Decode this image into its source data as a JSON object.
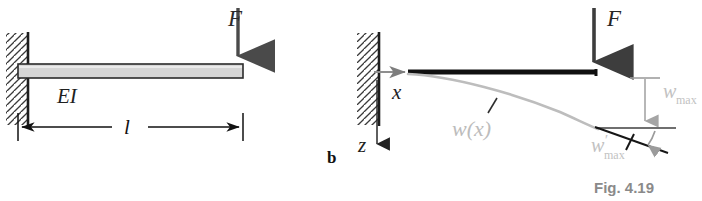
{
  "figure": {
    "caption": "Fig. 4.19",
    "caption_color": "#8a8a8a",
    "background": "#ffffff",
    "width": 702,
    "height": 201
  },
  "colors": {
    "ink_black": "#1a1a1a",
    "beam_outline": "#2b2b2b",
    "beam_fill": "#d6d6d6",
    "force_arrow": "#4a4a4a",
    "deflection_gray": "#b8b8b8",
    "axis_gray": "#9a9a9a",
    "hatch_gray": "#3a3a3a",
    "dimension_black": "#111111"
  },
  "panel_a": {
    "name": "undeformed-cantilever",
    "letter": "",
    "force_label": "F",
    "stiffness_label": "EI",
    "length_label": "l",
    "support_type": "fixed-wall-hatched",
    "beam": {
      "x_start": 18,
      "x_end": 243,
      "y_top": 64,
      "y_bottom": 78,
      "fill": "#d6d6d6",
      "stroke": "#2b2b2b"
    },
    "force": {
      "x": 238,
      "y_tail": 8,
      "y_head": 64,
      "direction": "down"
    },
    "dimension": {
      "y": 127,
      "x_left": 18,
      "x_right": 243,
      "label": "l"
    }
  },
  "panel_b": {
    "name": "deformed-cantilever",
    "letter": "b",
    "force_label": "F",
    "axis_x_label": "x",
    "axis_z_label": "z",
    "deflection_curve_label": "w(x)",
    "max_deflection_label_base": "w",
    "max_deflection_label_sub": "max",
    "max_slope_label_base": "w",
    "max_slope_label_prime": "′",
    "max_slope_label_sub": "max",
    "support_type": "fixed-wall-hatched",
    "beam": {
      "x_start": 408,
      "x_end": 597,
      "y": 72,
      "stroke": "#101010",
      "thickness": 5
    },
    "force": {
      "x": 594,
      "y_tail": 8,
      "y_head": 70,
      "direction": "down"
    },
    "x_axis": {
      "x_tail": 374,
      "x_head": 412,
      "y": 72,
      "direction": "right"
    },
    "z_axis": {
      "x": 376,
      "y_tail": 80,
      "y_head": 152,
      "direction": "down"
    },
    "deflection_curve": {
      "start_x": 408,
      "start_y": 74,
      "end_x": 598,
      "end_y": 130,
      "color": "#b8b8b8"
    },
    "w_max_annotation": {
      "x": 645,
      "y_top": 78,
      "y_bottom": 128,
      "tick_top_y": 78,
      "tick_bottom_y": 128,
      "direction": "down"
    },
    "tangent_line": {
      "x_start": 596,
      "y_start": 128,
      "x_end": 666,
      "y_end": 153
    },
    "reference_line": {
      "x_start": 596,
      "y_start": 128,
      "x_end": 674,
      "y_end": 128
    },
    "angle_arc": {
      "cx": 596,
      "cy": 128,
      "radius": 58
    }
  }
}
